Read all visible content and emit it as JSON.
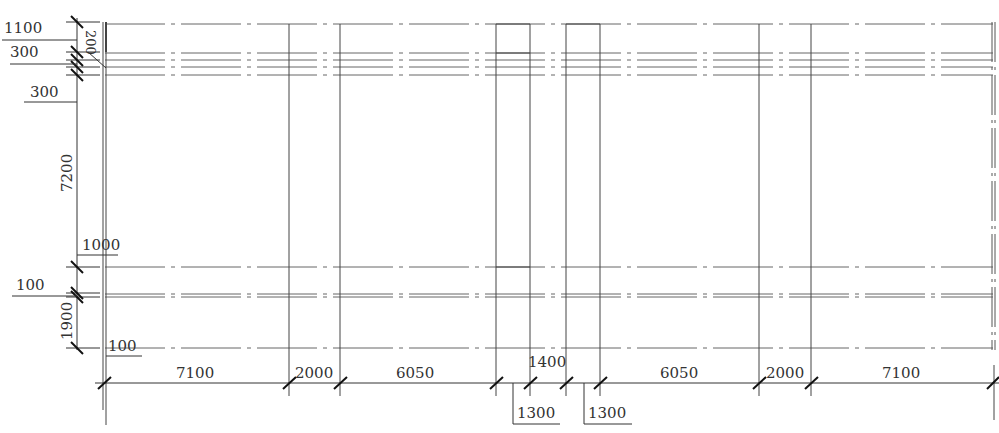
{
  "drawing": {
    "type": "structural grid plan",
    "colors": {
      "line": "#333333",
      "grid": "#555555",
      "background": "#ffffff"
    },
    "vertical_dimensions": [
      {
        "label": "1100",
        "y1": 22,
        "y2": 52,
        "label_x": 4,
        "label_y": 32,
        "leader_y": 40
      },
      {
        "label": "300",
        "y1": 52,
        "y2": 60,
        "label_x": 10,
        "label_y": 57,
        "leader_y": 64
      },
      {
        "label": "300",
        "y1": 67,
        "y2": 75,
        "label_x": 30,
        "label_y": 97,
        "leader_y": 102
      },
      {
        "label": "7200",
        "y1": 75,
        "y2": 267,
        "rotated": true
      },
      {
        "label": "1000",
        "y1": 267,
        "y2": 293,
        "label_x": 82,
        "label_y": 248,
        "leader_y": 255
      },
      {
        "label": "100",
        "y1": 293,
        "y2": 297,
        "label_x": 16,
        "label_y": 290,
        "leader_y": 296
      },
      {
        "label": "1900",
        "y1": 297,
        "y2": 348,
        "rotated": true
      },
      {
        "label": "100",
        "y1": 348,
        "y2": 352,
        "label_x": 108,
        "label_y": 350,
        "leader_y": 356
      }
    ],
    "inner_label": {
      "label": "200",
      "rotated": true
    },
    "horizontal_dimensions": [
      {
        "label": "7100",
        "x1": 105,
        "x2": 289
      },
      {
        "label": "2000",
        "x1": 289,
        "x2": 340
      },
      {
        "label": "6050",
        "x1": 340,
        "x2": 496
      },
      {
        "label": "1300",
        "x1": 496,
        "x2": 530,
        "below": true
      },
      {
        "label": "1400",
        "x1": 530,
        "x2": 566
      },
      {
        "label": "1300",
        "x1": 566,
        "x2": 600,
        "below": true
      },
      {
        "label": "6050",
        "x1": 600,
        "x2": 759
      },
      {
        "label": "2000",
        "x1": 759,
        "x2": 811
      },
      {
        "label": "7100",
        "x1": 811,
        "x2": 993
      }
    ],
    "labels": {
      "d1100": "1100",
      "d300a": "300",
      "d300b": "300",
      "d200": "200",
      "d7200": "7200",
      "d1000": "1000",
      "d100a": "100",
      "d1900": "1900",
      "d100b": "100",
      "h7100a": "7100",
      "h2000a": "2000",
      "h6050a": "6050",
      "h1300a": "1300",
      "h1400": "1400",
      "h1300b": "1300",
      "h6050b": "6050",
      "h2000b": "2000",
      "h7100b": "7100"
    }
  }
}
